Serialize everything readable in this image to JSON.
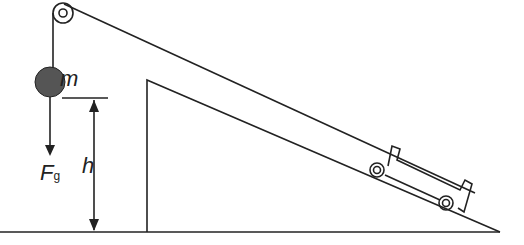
{
  "diagram": {
    "labels": {
      "mass": "m",
      "force": "F",
      "force_sub": "g",
      "height": "h"
    }
  }
}
